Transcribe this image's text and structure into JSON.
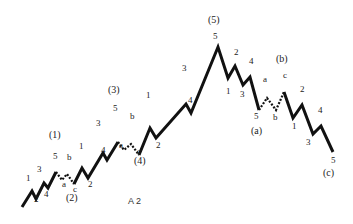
{
  "diagram": {
    "caption": "A 2",
    "line_color": "#111111",
    "segments": [
      {
        "style": "solid",
        "points": [
          [
            22,
            207
          ],
          [
            32,
            191
          ],
          [
            36,
            199
          ],
          [
            44,
            183
          ],
          [
            48,
            188
          ],
          [
            56,
            172
          ]
        ]
      },
      {
        "style": "dotted",
        "points": [
          [
            56,
            172
          ],
          [
            62,
            180
          ],
          [
            67,
            174
          ],
          [
            74,
            184
          ]
        ]
      },
      {
        "style": "solid",
        "points": [
          [
            74,
            184
          ],
          [
            82,
            168
          ],
          [
            88,
            178
          ],
          [
            103,
            153
          ],
          [
            107,
            160
          ],
          [
            118,
            142
          ]
        ]
      },
      {
        "style": "dotted",
        "points": [
          [
            118,
            142
          ],
          [
            124,
            150
          ],
          [
            131,
            144
          ],
          [
            139,
            155
          ]
        ]
      },
      {
        "style": "solid",
        "points": [
          [
            139,
            155
          ],
          [
            150,
            128
          ],
          [
            156,
            138
          ],
          [
            186,
            104
          ],
          [
            191,
            113
          ],
          [
            218,
            47
          ],
          [
            228,
            78
          ],
          [
            235,
            66
          ],
          [
            243,
            85
          ],
          [
            250,
            77
          ],
          [
            259,
            110
          ]
        ]
      },
      {
        "style": "dotted",
        "points": [
          [
            259,
            110
          ],
          [
            267,
            98
          ],
          [
            276,
            110
          ],
          [
            284,
            92
          ]
        ]
      },
      {
        "style": "solid",
        "points": [
          [
            284,
            92
          ],
          [
            293,
            118
          ],
          [
            302,
            105
          ],
          [
            313,
            134
          ],
          [
            321,
            126
          ],
          [
            333,
            152
          ]
        ]
      }
    ],
    "labels": [
      {
        "text": "1",
        "x": 26,
        "y": 181,
        "major": false
      },
      {
        "text": "2",
        "x": 34,
        "y": 202,
        "major": false
      },
      {
        "text": "3",
        "x": 37,
        "y": 172,
        "major": false
      },
      {
        "text": "4",
        "x": 44,
        "y": 197,
        "major": false
      },
      {
        "text": "5",
        "x": 53,
        "y": 159,
        "major": false
      },
      {
        "text": "(1)",
        "x": 49,
        "y": 138,
        "major": true
      },
      {
        "text": "a",
        "x": 62,
        "y": 187,
        "major": false
      },
      {
        "text": "b",
        "x": 67,
        "y": 160,
        "major": false
      },
      {
        "text": "c",
        "x": 73,
        "y": 192,
        "major": false
      },
      {
        "text": "(2)",
        "x": 66,
        "y": 201,
        "major": true
      },
      {
        "text": "1",
        "x": 79,
        "y": 149,
        "major": false
      },
      {
        "text": "2",
        "x": 88,
        "y": 187,
        "major": false
      },
      {
        "text": "3",
        "x": 96,
        "y": 126,
        "major": false
      },
      {
        "text": "4",
        "x": 101,
        "y": 153,
        "major": false
      },
      {
        "text": "5",
        "x": 113,
        "y": 111,
        "major": false
      },
      {
        "text": "(3)",
        "x": 108,
        "y": 93,
        "major": true
      },
      {
        "text": "a",
        "x": 119,
        "y": 148,
        "major": false
      },
      {
        "text": "b",
        "x": 130,
        "y": 119,
        "major": false
      },
      {
        "text": "c",
        "x": 137,
        "y": 154,
        "major": false
      },
      {
        "text": "(4)",
        "x": 134,
        "y": 164,
        "major": true
      },
      {
        "text": "1",
        "x": 146,
        "y": 98,
        "major": false
      },
      {
        "text": "2",
        "x": 156,
        "y": 148,
        "major": false
      },
      {
        "text": "3",
        "x": 182,
        "y": 71,
        "major": false
      },
      {
        "text": "4",
        "x": 188,
        "y": 103,
        "major": false
      },
      {
        "text": "5",
        "x": 213,
        "y": 39,
        "major": false
      },
      {
        "text": "(5)",
        "x": 208,
        "y": 23,
        "major": true
      },
      {
        "text": "1",
        "x": 226,
        "y": 94,
        "major": false
      },
      {
        "text": "2",
        "x": 234,
        "y": 55,
        "major": false
      },
      {
        "text": "3",
        "x": 240,
        "y": 97,
        "major": false
      },
      {
        "text": "4",
        "x": 249,
        "y": 64,
        "major": false
      },
      {
        "text": "5",
        "x": 254,
        "y": 119,
        "major": false
      },
      {
        "text": "a",
        "x": 263,
        "y": 82,
        "major": false
      },
      {
        "text": "(a)",
        "x": 251,
        "y": 134,
        "major": true
      },
      {
        "text": "b",
        "x": 273,
        "y": 120,
        "major": false
      },
      {
        "text": "c",
        "x": 283,
        "y": 78,
        "major": false
      },
      {
        "text": "(b)",
        "x": 276,
        "y": 62,
        "major": true
      },
      {
        "text": "1",
        "x": 292,
        "y": 129,
        "major": false
      },
      {
        "text": "2",
        "x": 300,
        "y": 92,
        "major": false
      },
      {
        "text": "3",
        "x": 306,
        "y": 145,
        "major": false
      },
      {
        "text": "4",
        "x": 318,
        "y": 113,
        "major": false
      },
      {
        "text": "5",
        "x": 331,
        "y": 163,
        "major": false
      },
      {
        "text": "(c)",
        "x": 323,
        "y": 176,
        "major": true
      }
    ]
  }
}
